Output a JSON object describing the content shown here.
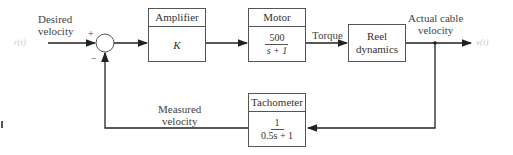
{
  "input": {
    "signal": "r(t)",
    "label_line1": "Desired",
    "label_line2": "velocity"
  },
  "summing_junction": {
    "plus_sign": "+",
    "minus_sign": "−"
  },
  "blocks": {
    "amplifier": {
      "title": "Amplifier",
      "gain": "K"
    },
    "motor": {
      "title": "Motor",
      "numerator": "500",
      "denominator": "s + 1"
    },
    "reel": {
      "line1": "Reel",
      "line2": "dynamics"
    },
    "tachometer": {
      "title": "Tachometer",
      "numerator": "1",
      "denominator": "0.5s + 1"
    }
  },
  "signals": {
    "torque": "Torque",
    "output_label_line1": "Actual cable",
    "output_label_line2": "velocity",
    "output_signal": "v(t)",
    "feedback_label_line1": "Measured",
    "feedback_label_line2": "velocity"
  },
  "colors": {
    "line": "#222222",
    "box_border": "#555555",
    "faint_signal": "#c8c8c8"
  }
}
